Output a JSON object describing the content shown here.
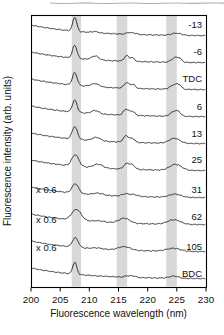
{
  "figure": {
    "background_color": "#ffffff",
    "artifact_color": "#9e9e9e"
  },
  "chart_data": {
    "type": "line",
    "title": "",
    "xlabel": "Fluorescence wavelength (nm)",
    "ylabel": "Fluorescence intensity (arb. units)",
    "xlim": [
      200,
      230
    ],
    "x_ticks": [
      200,
      205,
      210,
      215,
      220,
      225,
      230
    ],
    "grid": false,
    "legend": "none",
    "band_color": "#d8d8d8",
    "line_color": "#1c1c1c",
    "frame_color": "#000000",
    "text_color": "#111111",
    "shaded_bands_nm": [
      [
        207.0,
        208.6
      ],
      [
        214.7,
        216.5
      ],
      [
        223.2,
        225.0
      ]
    ],
    "plot_box_px": {
      "left": 31,
      "top": 15,
      "right": 206,
      "bottom": 287
    },
    "baseline_drop_px": 11,
    "baseline_tau_nm": 9,
    "scale_factor_text": "x 0.6",
    "series": [
      {
        "label": "-13",
        "base_y": 36,
        "label_dy": -11,
        "peaks": [
          [
            207.5,
            14,
            0.35
          ],
          [
            211.0,
            1.2,
            0.6
          ],
          [
            216.8,
            1.8,
            0.45
          ],
          [
            217.8,
            1.2,
            0.4
          ],
          [
            224.9,
            2.2,
            0.8
          ]
        ]
      },
      {
        "label": "-6",
        "base_y": 63,
        "label_dy": -11,
        "peaks": [
          [
            207.5,
            13,
            0.38
          ],
          [
            211.0,
            3.8,
            0.6
          ],
          [
            216.4,
            5.5,
            0.4
          ],
          [
            217.4,
            3.5,
            0.35
          ],
          [
            224.7,
            4.5,
            0.6
          ],
          [
            225.5,
            2.5,
            0.4
          ]
        ]
      },
      {
        "label": "TDC",
        "base_y": 90,
        "label_dy": -11,
        "peaks": [
          [
            207.5,
            12.5,
            0.4
          ],
          [
            211.0,
            3.2,
            0.7
          ],
          [
            216.4,
            5.5,
            0.45
          ],
          [
            217.5,
            3.8,
            0.4
          ],
          [
            224.6,
            4.5,
            0.7
          ],
          [
            225.4,
            2.8,
            0.4
          ]
        ]
      },
      {
        "label": "6",
        "base_y": 117,
        "label_dy": -10.5,
        "peaks": [
          [
            207.5,
            12,
            0.4
          ],
          [
            211.0,
            3.2,
            0.65
          ],
          [
            216.3,
            6,
            0.45
          ],
          [
            217.4,
            4,
            0.4
          ],
          [
            224.5,
            4.5,
            0.6
          ],
          [
            225.3,
            3.2,
            0.45
          ]
        ]
      },
      {
        "label": "13",
        "base_y": 144,
        "label_dy": -10.5,
        "peaks": [
          [
            207.5,
            12.5,
            0.45
          ],
          [
            211.2,
            3.5,
            0.7
          ],
          [
            216.3,
            6.5,
            0.45
          ],
          [
            217.4,
            3.8,
            0.4
          ],
          [
            224.6,
            5,
            0.9
          ]
        ]
      },
      {
        "label": "25",
        "base_y": 171,
        "label_dy": -11,
        "peaks": [
          [
            207.6,
            11.5,
            0.6
          ],
          [
            211.5,
            3.8,
            0.8
          ],
          [
            216.4,
            5.5,
            0.5
          ],
          [
            217.4,
            4,
            0.45
          ],
          [
            224.8,
            6,
            1.0
          ]
        ]
      },
      {
        "label": "31",
        "base_y": 198,
        "label_dy": -8,
        "scale_label": "x 0.6",
        "scale_dy": -8.5,
        "peaks": [
          [
            207.6,
            9.5,
            0.55
          ],
          [
            211.5,
            1.8,
            0.8
          ],
          [
            216.2,
            2.2,
            0.6
          ],
          [
            217.6,
            1.8,
            0.7
          ],
          [
            224.7,
            3.2,
            1.0
          ]
        ]
      },
      {
        "label": "62",
        "base_y": 225,
        "label_dy": -8.5,
        "scale_label": "x 0.6",
        "scale_dy": -5.5,
        "peaks": [
          [
            207.8,
            11,
            0.8
          ],
          [
            211.5,
            1.2,
            1.0
          ],
          [
            216.0,
            5,
            0.9
          ],
          [
            224.5,
            4.5,
            1.1
          ]
        ]
      },
      {
        "label": "105",
        "base_y": 252,
        "label_dy": -5.5,
        "scale_label": "x 0.6",
        "scale_dy": -4.5,
        "peaks": [
          [
            207.6,
            9.5,
            0.5
          ],
          [
            211.3,
            1.0,
            0.8
          ],
          [
            216.0,
            3.5,
            1.0
          ],
          [
            224.4,
            3,
            1.2
          ]
        ]
      },
      {
        "label": "BDC",
        "base_y": 279,
        "label_dy": -5.5,
        "peaks": [
          [
            207.5,
            12,
            0.35
          ],
          [
            216.6,
            1.4,
            0.5
          ],
          [
            217.6,
            1.3,
            0.4
          ],
          [
            224.5,
            2.2,
            0.8
          ]
        ]
      }
    ]
  }
}
